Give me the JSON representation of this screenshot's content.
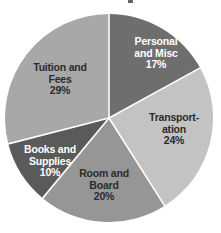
{
  "chart_data": {
    "type": "pie",
    "title": "",
    "xlabel": "",
    "ylabel": "",
    "legend": "none",
    "grid": false,
    "start_angle_deg": 0,
    "direction": "clockwise",
    "categories": [
      "Personal and Misc",
      "Transportation",
      "Room and Board",
      "Books and Supplies",
      "Tuition and Fees"
    ],
    "values": [
      17,
      24,
      20,
      10,
      29
    ],
    "value_unit": "percent",
    "slices": [
      {
        "name": "Personal and Misc",
        "value": 17,
        "percent_label": "17%",
        "label_lines": [
          "Personal",
          "and Misc",
          "17%"
        ],
        "color": "#6e6e6e",
        "text_color": "#ffffff",
        "start_deg": 0,
        "end_deg": 61.2
      },
      {
        "name": "Transportation",
        "value": 24,
        "percent_label": "24%",
        "label_lines": [
          "Transport-",
          "ation",
          "24%"
        ],
        "color": "#c3c3c3",
        "text_color": "#2b2b2b",
        "start_deg": 61.2,
        "end_deg": 147.6
      },
      {
        "name": "Room and Board",
        "value": 20,
        "percent_label": "20%",
        "label_lines": [
          "Room and",
          "Board",
          "20%"
        ],
        "color": "#969696",
        "text_color": "#2b2b2b",
        "start_deg": 147.6,
        "end_deg": 219.6
      },
      {
        "name": "Books and Supplies",
        "value": 10,
        "percent_label": "10%",
        "label_lines": [
          "Books and",
          "Supplies",
          "10%"
        ],
        "color": "#5a5a5a",
        "text_color": "#ffffff",
        "start_deg": 219.6,
        "end_deg": 255.6
      },
      {
        "name": "Tuition and Fees",
        "value": 29,
        "percent_label": "29%",
        "label_lines": [
          "Tuition and",
          "Fees",
          "29%"
        ],
        "color": "#a8a8a8",
        "text_color": "#2b2b2b",
        "start_deg": 255.6,
        "end_deg": 360
      }
    ],
    "geometry": {
      "center_x": 109,
      "center_y": 118,
      "radius": 104,
      "separator_color": "#ffffff",
      "separator_width": 1.6
    },
    "label_positions": [
      {
        "x": 114,
        "y": 36,
        "width": 84
      },
      {
        "x": 134,
        "y": 112,
        "width": 80
      },
      {
        "x": 62,
        "y": 168,
        "width": 84
      },
      {
        "x": 8,
        "y": 144,
        "width": 84
      },
      {
        "x": 17,
        "y": 62,
        "width": 86
      }
    ]
  },
  "canvas": {
    "background": "#ffffff",
    "width": 221,
    "height": 233
  }
}
